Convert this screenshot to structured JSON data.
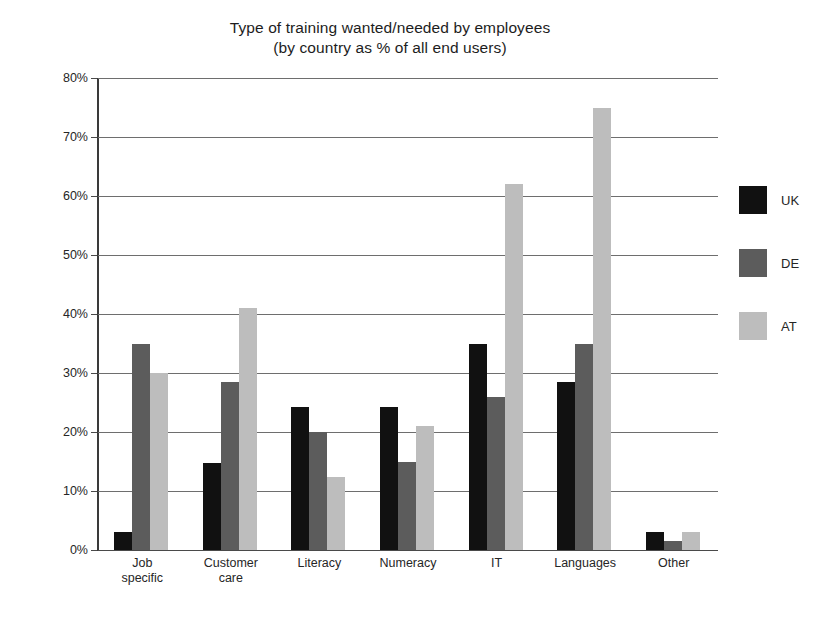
{
  "chart_data": {
    "type": "bar",
    "title": "Type of training wanted/needed by employees",
    "subtitle": "(by country as % of all end users)",
    "xlabel": "",
    "ylabel": "",
    "ylim": [
      0,
      80
    ],
    "ytick_labels": [
      "80%",
      "70%",
      "60%",
      "50%",
      "40%",
      "30%",
      "20%",
      "10%",
      "0%"
    ],
    "ytick_values": [
      80,
      70,
      60,
      50,
      40,
      30,
      20,
      10,
      0
    ],
    "grid": true,
    "legend_position": "right",
    "categories": [
      "Job specific",
      "Customer care",
      "Literacy",
      "Numeracy",
      "IT",
      "Languages",
      "Other"
    ],
    "category_lines": [
      [
        "Job",
        "specific"
      ],
      [
        "Customer",
        "care"
      ],
      [
        "Literacy"
      ],
      [
        "Numeracy"
      ],
      [
        "IT"
      ],
      [
        "Languages"
      ],
      [
        "Other"
      ]
    ],
    "series": [
      {
        "name": "UK",
        "color": "#111111",
        "values": [
          3.0,
          14.8,
          24.3,
          24.3,
          35.0,
          28.5,
          3.0
        ]
      },
      {
        "name": "DE",
        "color": "#5c5c5c",
        "values": [
          35.0,
          28.5,
          20.0,
          15.0,
          26.0,
          35.0,
          1.5
        ]
      },
      {
        "name": "AT",
        "color": "#bdbdbd",
        "values": [
          30.0,
          41.0,
          12.3,
          21.0,
          62.0,
          75.0,
          3.0
        ]
      }
    ]
  },
  "legend": {
    "entries": [
      {
        "label": "UK",
        "color": "#111111"
      },
      {
        "label": "DE",
        "color": "#5c5c5c"
      },
      {
        "label": "AT",
        "color": "#bdbdbd"
      }
    ]
  },
  "colors": {
    "background": "#ffffff",
    "axis": "#3a3a3a",
    "gridline": "#6e6e6e",
    "text": "#262626"
  }
}
